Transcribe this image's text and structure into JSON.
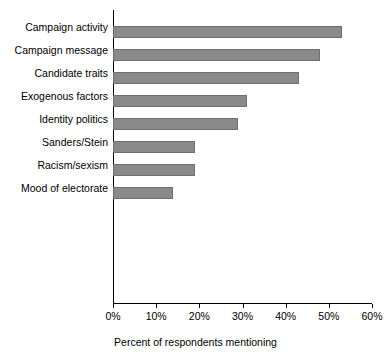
{
  "chart_data": {
    "type": "bar",
    "orientation": "horizontal",
    "title": "",
    "subtitle": "",
    "xlabel": "Percent of respondents mentioning",
    "ylabel": "",
    "categories": [
      "Campaign activity",
      "Campaign message",
      "Candidate traits",
      "Exogenous factors",
      "Identity politics",
      "Sanders/Stein",
      "Racism/sexism",
      "Mood of electorate"
    ],
    "values": [
      53,
      48,
      43,
      31,
      29,
      19,
      19,
      14
    ],
    "xlim": [
      0,
      60
    ],
    "x_tick_values": [
      0,
      10,
      20,
      30,
      40,
      50,
      60
    ],
    "x_tick_labels": [
      "0%",
      "10%",
      "20%",
      "30%",
      "40%",
      "50%",
      "60%"
    ],
    "grid": false,
    "legend": null,
    "legend_position": "none",
    "bar_color": "#8a8a8a",
    "bar_border_color": "#6f6f6f",
    "axis_color": "#000000",
    "background_color": "#ffffff"
  }
}
